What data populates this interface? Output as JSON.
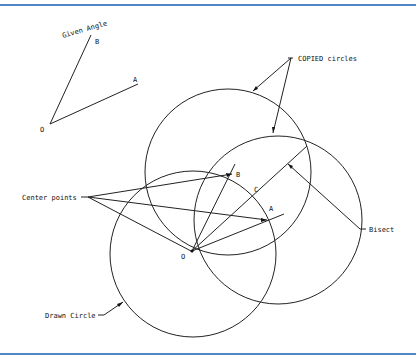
{
  "diagram": {
    "colors": {
      "frame": "#4f86c6",
      "ink": "#222222",
      "background": "#ffffff"
    },
    "given_angle": {
      "label": "Given Angle",
      "vertex_label": "O",
      "ray_b_label": "B",
      "ray_a_label": "A"
    },
    "construction": {
      "vertex_label": "O",
      "point_b_label": "B",
      "point_a_label": "A",
      "point_c_label": "C"
    },
    "callouts": {
      "copied_circles": "COPIED circles",
      "center_points": "Center points",
      "drawn_circle": "Drawn Circle",
      "bisect": "Bisect"
    }
  }
}
